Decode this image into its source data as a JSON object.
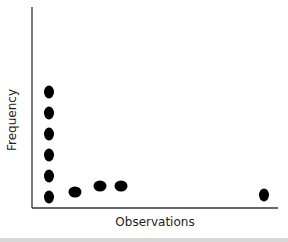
{
  "chart_data": {
    "type": "scatter",
    "title": "",
    "xlabel": "Observations",
    "ylabel": "Frequency",
    "grid": false,
    "ticks": false,
    "points": [
      {
        "x": 1,
        "y": 1
      },
      {
        "x": 1,
        "y": 2
      },
      {
        "x": 1,
        "y": 3
      },
      {
        "x": 1,
        "y": 4
      },
      {
        "x": 1,
        "y": 5
      },
      {
        "x": 1,
        "y": 6
      },
      {
        "x": 2,
        "y": 1.3
      },
      {
        "x": 3,
        "y": 1.6
      },
      {
        "x": 4,
        "y": 1.6
      },
      {
        "x": 10,
        "y": 1
      }
    ],
    "pixel_points": [
      [
        49,
        197
      ],
      [
        49,
        176
      ],
      [
        49,
        155
      ],
      [
        49,
        134
      ],
      [
        49,
        113
      ],
      [
        49,
        92
      ],
      [
        75,
        192
      ],
      [
        100,
        186
      ],
      [
        121,
        186
      ],
      [
        264,
        195
      ]
    ],
    "marker_color": "#000000",
    "axis_color": "#333333"
  }
}
